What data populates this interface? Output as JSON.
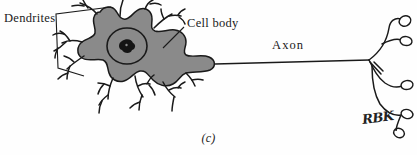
{
  "figure": {
    "caption": "(c)",
    "signature": "RBK",
    "background_color": "#fefefe",
    "soma_fill_color": "#8a8a8a",
    "ink_color": "#1a1a1a"
  },
  "labels": {
    "dendrites": "Dendrites",
    "cell_body": "Cell body",
    "axon": "Axon"
  },
  "parts": {
    "soma": "cell-body-soma",
    "nucleus": "nucleus",
    "nucleolus": "nucleolus",
    "dendrite_bracket": "dendrite-bracket",
    "cell_body_leader": "cell-body-leader-line",
    "axon_line": "axon-line",
    "axon_terminals": "axon-terminal-branches",
    "synaptic_boutons": "synaptic-boutons"
  }
}
